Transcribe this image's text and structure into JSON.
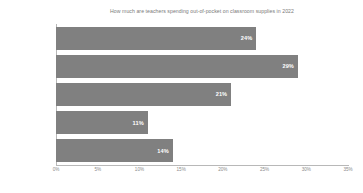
{
  "chart_data": {
    "type": "bar",
    "orientation": "horizontal",
    "title": "How much are teachers spending out-of-pocket on classroom supplies in 2022",
    "xlabel": "",
    "ylabel": "",
    "categories": [
      "$1 - $249",
      "$250 - $499",
      "$500 - $749",
      "$750 - $999",
      "$1,000"
    ],
    "values": [
      24,
      29,
      21,
      11,
      14
    ],
    "data_labels": [
      "24%",
      "29%",
      "21%",
      "11%",
      "14%"
    ],
    "xlim": [
      0,
      35
    ],
    "xticks": [
      0,
      5,
      10,
      15,
      20,
      25,
      30,
      35
    ],
    "xtick_labels": [
      "0%",
      "5%",
      "10%",
      "15%",
      "20%",
      "25%",
      "30%",
      "35%"
    ],
    "grid": false,
    "legend": false,
    "bar_color": "#808080",
    "data_label_color": "#ffffff",
    "axis_color": "#b8b8b8",
    "text_color": "#8a8a8a",
    "background": "#ffffff"
  }
}
